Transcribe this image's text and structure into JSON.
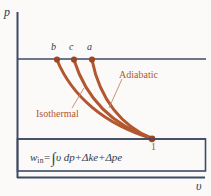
{
  "figure": {
    "kind": "p-v diagram",
    "background_color": "#fbfaf8",
    "line_color": "#3d4a63",
    "curve_color": "#b2572f"
  },
  "axes": {
    "y_label": "p",
    "x_label": "υ",
    "y_axis_x": 17,
    "x_axis_y": 178,
    "upper_line_y": 59,
    "lower_line_y": 139,
    "right_extent": 205
  },
  "points": [
    {
      "id": "b",
      "label": "b",
      "x": 57,
      "y": 59,
      "label_x": 51,
      "label_y": 43
    },
    {
      "id": "c",
      "label": "c",
      "x": 74,
      "y": 59,
      "label_x": 69,
      "label_y": 43
    },
    {
      "id": "a",
      "label": "a",
      "x": 92,
      "y": 59,
      "label_x": 87,
      "label_y": 43
    },
    {
      "id": "1",
      "label": "1",
      "x": 152,
      "y": 139,
      "label_x": 150,
      "label_y": 142
    }
  ],
  "curves": [
    {
      "name": "isothermal",
      "from": "b",
      "to": "1"
    },
    {
      "name": "polytropic",
      "from": "c",
      "to": "1"
    },
    {
      "name": "adiabatic",
      "from": "a",
      "to": "1"
    }
  ],
  "annotations": [
    {
      "id": "adiabatic",
      "text": "Adiabatic",
      "x": 119,
      "y": 72
    },
    {
      "id": "isothermal",
      "text": "Isothermal",
      "x": 36,
      "y": 111
    }
  ],
  "equation": {
    "lhs_symbol": "w",
    "lhs_subscript": "in",
    "equals": "=",
    "integral": "∫",
    "integrand": "υ dp",
    "plus": "+",
    "term_ke": "Δke",
    "term_pe": "Δpe",
    "plain": "w_in = ∫ υ dp + Δke + Δpe",
    "x": 30,
    "y": 153
  }
}
